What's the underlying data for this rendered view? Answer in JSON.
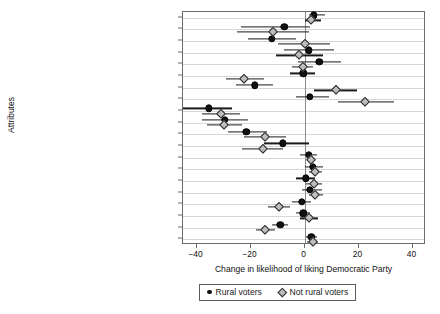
{
  "chart_data": {
    "type": "scatter",
    "title": "",
    "xlabel": "Change in likelihood of liking Democratic Party",
    "ylabel": "Attributes",
    "xlim": [
      -45,
      45
    ],
    "xticks": [
      -40,
      -20,
      0,
      20,
      40
    ],
    "xticklabels": [
      "−40",
      "−20",
      "0",
      "20",
      "40"
    ],
    "grid": "horizontal",
    "legend_position": "below-axis",
    "zero_reference_line": 0,
    "categories": [
      "Personal well-being",
      "Place-based anxiety",
      "Place-based grievance",
      "Cultural precarity",
      "Patriotism",
      "Evangelicalism",
      "Civic pride",
      "Social Capital",
      "Conspiracism",
      "Racial resentment",
      "Anticosmpolitianism",
      "White",
      "Latino",
      "Female",
      "Below 35",
      "Over 65",
      "College degree",
      "Conservative self-placement",
      "Follows news",
      "Household income"
    ],
    "series": [
      {
        "name": "Rural voters",
        "marker": "filled-circle",
        "color": "#111111",
        "values": [
          3.5,
          -7.5,
          -12.0,
          1.5,
          5.5,
          -0.5,
          -18.5,
          2.0,
          -35.5,
          -29.5,
          -21.5,
          -8.0,
          1.5,
          3.0,
          0.5,
          2.0,
          -1.0,
          -0.5,
          -9.0,
          2.5
        ],
        "ci_low": [
          1.5,
          -23.5,
          -21.0,
          -7.5,
          -2.5,
          -5.5,
          -25.5,
          -3.0,
          -45.0,
          -38.0,
          -28.5,
          -15.0,
          -1.5,
          0.0,
          -3.0,
          -1.0,
          -4.5,
          -3.0,
          -12.0,
          0.5
        ],
        "ci_high": [
          7.5,
          2.0,
          -3.0,
          11.0,
          13.5,
          4.0,
          -11.5,
          9.0,
          -27.0,
          -21.0,
          -14.0,
          1.5,
          4.5,
          7.0,
          4.0,
          6.5,
          2.5,
          2.0,
          -6.0,
          4.5
        ]
      },
      {
        "name": "Not rural voters",
        "marker": "open-diamond",
        "color": "#bdbdbd",
        "values": [
          2.5,
          -11.5,
          0.0,
          -2.0,
          -0.5,
          -22.5,
          11.5,
          22.5,
          -31.0,
          -30.0,
          -14.5,
          -15.5,
          2.5,
          4.0,
          3.5,
          4.0,
          -9.5,
          1.5,
          -14.5,
          3.0
        ],
        "ci_low": [
          0.0,
          -25.0,
          -10.0,
          -10.5,
          -4.5,
          -29.0,
          3.5,
          12.5,
          -38.0,
          -36.0,
          -22.5,
          -23.0,
          1.0,
          1.5,
          0.5,
          1.5,
          -13.5,
          -1.5,
          -18.0,
          1.0
        ],
        "ci_high": [
          6.0,
          1.5,
          9.5,
          7.0,
          3.0,
          -15.0,
          19.5,
          33.0,
          -24.0,
          -23.0,
          -7.0,
          -8.0,
          4.0,
          6.5,
          6.5,
          7.0,
          -5.5,
          5.0,
          -11.0,
          5.0
        ]
      }
    ]
  },
  "legend": {
    "items": [
      {
        "label": "Rural voters"
      },
      {
        "label": "Not rural voters"
      }
    ]
  }
}
